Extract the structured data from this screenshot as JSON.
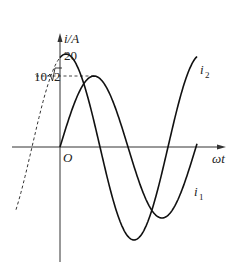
{
  "diagram": {
    "y_axis_label": "i/A",
    "x_axis_label": "ωt",
    "origin_label": "O",
    "tick_20": "20",
    "tick_10sqrt2_coeff": "10",
    "tick_10sqrt2_radicand": "2",
    "curve_labels": {
      "i1": "i",
      "i1_sub": "1",
      "i2": "i",
      "i2_sub": "2"
    }
  },
  "chart_data": {
    "type": "line",
    "title": "",
    "xlabel": "ωt",
    "ylabel": "i/A",
    "series": [
      {
        "name": "i1",
        "amplitude": 14.14,
        "amplitude_label": "10√2",
        "phase_deg": 0,
        "expression": "i1 = 10√2 sin(ωt)"
      },
      {
        "name": "i2",
        "amplitude": 20,
        "amplitude_label": "20",
        "phase_deg": 90,
        "expression": "i2 = 20 sin(ωt + 90°)"
      }
    ],
    "annotations": [
      "20",
      "10√2",
      "O"
    ],
    "grid": false
  }
}
